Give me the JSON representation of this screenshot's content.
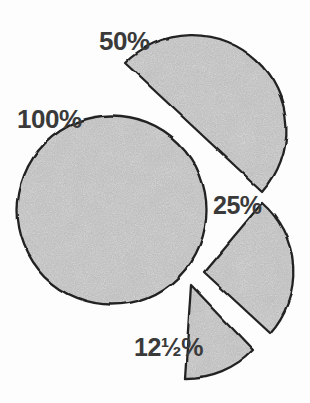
{
  "diagram": {
    "segments": [
      {
        "id": "whole",
        "label": "100%",
        "fraction": 1.0,
        "shape": "full circle"
      },
      {
        "id": "half",
        "label": "50%",
        "fraction": 0.5,
        "shape": "half circle"
      },
      {
        "id": "quarter",
        "label": "25%",
        "fraction": 0.25,
        "shape": "quarter circle"
      },
      {
        "id": "eighth",
        "label": "12½%",
        "fraction": 0.125,
        "shape": "eighth wedge"
      }
    ],
    "colors": {
      "shape_fill": "#dadada",
      "outline": "#232323",
      "background": "#fdfdfd",
      "label_text": "#3a3a3a"
    }
  }
}
